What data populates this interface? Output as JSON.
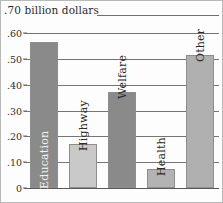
{
  "caption": {
    "text": ".70 billion dollars"
  },
  "axis": {
    "y_ticks": [
      ".60",
      ".50",
      ".40",
      ".30",
      ".20",
      ".10",
      "0"
    ],
    "y_tick_values": [
      0.6,
      0.5,
      0.4,
      0.3,
      0.2,
      0.1,
      0.0
    ]
  },
  "bars": [
    {
      "label": "Education",
      "value": 0.565,
      "color": "#8a8a8a",
      "label_placement": "on-bar"
    },
    {
      "label": "Highway",
      "value": 0.172,
      "color": "#c9c9c9",
      "label_placement": "above-bar"
    },
    {
      "label": "Welfare",
      "value": 0.37,
      "color": "#8a8a8a",
      "label_placement": "above-bar"
    },
    {
      "label": "Health",
      "value": 0.072,
      "color": "#b3b3b3",
      "label_placement": "above-bar"
    },
    {
      "label": "Other",
      "value": 0.513,
      "color": "#b0b0b0",
      "label_placement": "above-bar"
    }
  ],
  "chart_data": {
    "type": "bar",
    "title": ".70 billion dollars",
    "xlabel": "",
    "ylabel": "billion dollars",
    "categories": [
      "Education",
      "Highway",
      "Welfare",
      "Health",
      "Other"
    ],
    "values": [
      0.565,
      0.172,
      0.37,
      0.072,
      0.513
    ],
    "ylim": [
      0,
      0.7
    ],
    "yticks": [
      0,
      0.1,
      0.2,
      0.3,
      0.4,
      0.5,
      0.6
    ],
    "ytick_labels": [
      "0",
      ".10",
      ".20",
      ".30",
      ".40",
      ".50",
      ".60"
    ],
    "grid": true,
    "legend": false,
    "bar_colors": [
      "#8a8a8a",
      "#c9c9c9",
      "#8a8a8a",
      "#b3b3b3",
      "#b0b0b0"
    ],
    "annotations": [
      {
        "text": "Education",
        "orientation": "vertical",
        "inside_bar": true
      },
      {
        "text": "Highway",
        "orientation": "vertical",
        "inside_bar": false
      },
      {
        "text": "Welfare",
        "orientation": "vertical",
        "inside_bar": false
      },
      {
        "text": "Health",
        "orientation": "vertical",
        "inside_bar": false
      },
      {
        "text": "Other",
        "orientation": "vertical",
        "inside_bar": false
      }
    ]
  }
}
